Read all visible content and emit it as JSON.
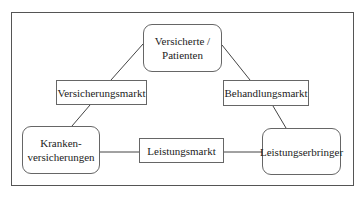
{
  "diagram": {
    "type": "triangle-relationship",
    "nodes": [
      {
        "id": "versicherte",
        "text": "Versicherte /\nPatienten"
      },
      {
        "id": "krankenversicherungen",
        "text": "Kranken-\nversicherungen"
      },
      {
        "id": "leistungserbringer",
        "text": "Leistungserbringer"
      }
    ],
    "edges": [
      {
        "from": "versicherte",
        "to": "krankenversicherungen",
        "label": "Versicherungsmarkt"
      },
      {
        "from": "versicherte",
        "to": "leistungserbringer",
        "label": "Behandlungsmarkt"
      },
      {
        "from": "krankenversicherungen",
        "to": "leistungserbringer",
        "label": "Leistungsmarkt"
      }
    ]
  }
}
